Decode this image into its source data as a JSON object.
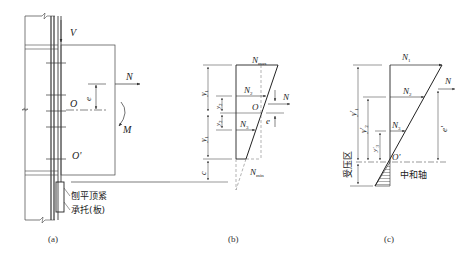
{
  "panels": {
    "a": {
      "caption": "(a)",
      "labels": {
        "shear": "V",
        "axial": "N",
        "moment": "M",
        "eccentricity": "e",
        "center": "O",
        "center_prime": "O'",
        "note_top": "刨平顶紧",
        "note_bottom": "承托(板)"
      }
    },
    "b": {
      "caption": "(b)",
      "labels": {
        "n_max": "N",
        "n_max_sub": "max",
        "n_min": "N",
        "n_min_sub": "min",
        "n2": "N",
        "n2_sub": "2",
        "n3": "N",
        "n3_sub": "3",
        "center": "O",
        "axial": "N",
        "eccentricity": "e",
        "y1_top": "y",
        "y1_top_sub": "1",
        "y2_top": "y",
        "y2_top_sub": "2",
        "y2_bottom": "y",
        "y2_bottom_sub": "2",
        "y1_bottom": "y",
        "y1_bottom_sub": "1",
        "c": "c"
      }
    },
    "c": {
      "caption": "(c)",
      "labels": {
        "n1": "N",
        "n1_sub": "1",
        "n2": "N",
        "n2_sub": "2",
        "n3": "N",
        "n3_sub": "3",
        "axial": "N",
        "center_prime": "O'",
        "y1": "y'",
        "y1_sub": "1",
        "y2": "y'",
        "y2_sub": "2",
        "y3": "y'",
        "y3_sub": "3",
        "e_prime": "e'",
        "compression_zone": "受压区",
        "neutral_axis": "中和轴"
      }
    }
  },
  "colors": {
    "line": "#333333",
    "dashed": "#666666",
    "background": "#ffffff"
  }
}
